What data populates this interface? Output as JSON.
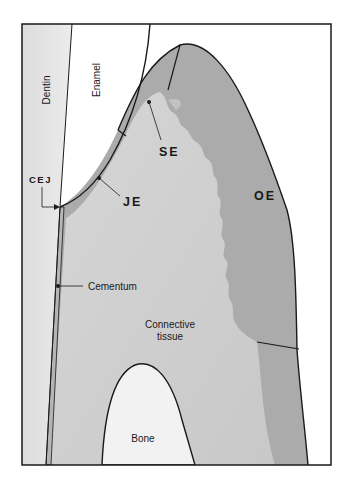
{
  "figure": {
    "type": "anatomical-diagram",
    "colors": {
      "background": "#ffffff",
      "frame": "#1a1a1a",
      "dentin": "#e4e4e4",
      "enamel": "#ffffff",
      "connective_tissue": "#cfcfcf",
      "epithelium": "#a9a9a9",
      "bone": "#f2f2f2",
      "cementum": "#b5b5b5"
    }
  },
  "labels": {
    "dentin": "Dentin",
    "enamel": "Enamel",
    "se": "SE",
    "je": "JE",
    "cej": "CEJ",
    "oe": "OE",
    "cementum": "Cementum",
    "connective_line1": "Connective",
    "connective_line2": "tissue",
    "bone": "Bone"
  }
}
